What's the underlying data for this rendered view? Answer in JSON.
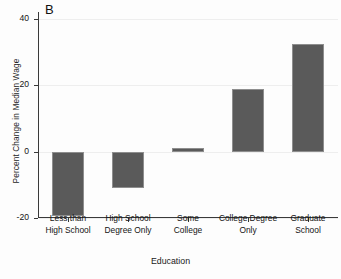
{
  "chart_data": {
    "type": "bar",
    "title": "",
    "panel_label": "B",
    "categories": [
      "Less than\nHigh School",
      "High School\nDegree Only",
      "Some\nCollege",
      "College Degree\nOnly",
      "Graduate\nSchool"
    ],
    "category_lines": [
      [
        "Less than",
        "High School"
      ],
      [
        "High School",
        "Degree Only"
      ],
      [
        "Some",
        "College"
      ],
      [
        "College Degree",
        "Only"
      ],
      [
        "Graduate",
        "School"
      ]
    ],
    "values": [
      -19.5,
      -11.0,
      1.0,
      18.8,
      32.5
    ],
    "xlabel": "Education",
    "ylabel": "Percent Change in Median Wage",
    "ylim": [
      -20,
      42
    ],
    "yticks": [
      40,
      20,
      0,
      -20
    ],
    "ytick_labels": [
      "40",
      "20",
      "0",
      "-20"
    ],
    "grid": true,
    "legend": "none",
    "bar_color": "#5a5a5a",
    "bar_edge_color": "#8e8e8e",
    "axis_color": "#3a3a3a",
    "grid_color": "#eeeeee",
    "background": "#fdfdfd"
  }
}
